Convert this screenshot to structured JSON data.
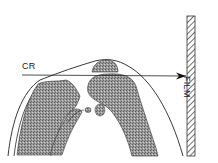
{
  "diagram": {
    "labels": {
      "central_ray": "CR",
      "film": "FILM"
    },
    "parts": [
      "skin-outline",
      "femur",
      "tibia",
      "fibula",
      "patella",
      "central-ray-arrow",
      "film-plate"
    ],
    "colors": {
      "bone_fill": "#8a8a8a",
      "line": "#222222",
      "background": "#ffffff"
    }
  }
}
